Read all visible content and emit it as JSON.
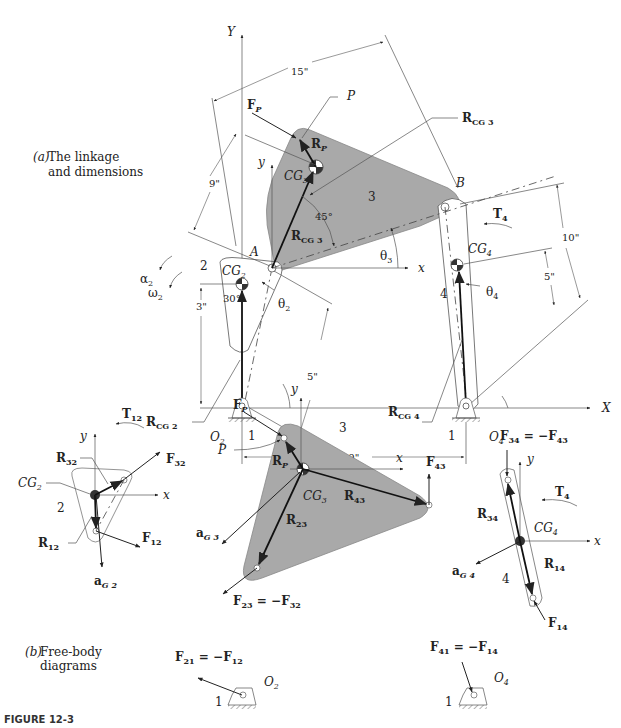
{
  "figure": {
    "caption": "FIGURE 12-3",
    "part_a": {
      "tag": "(a)",
      "title_line1": "The linkage",
      "title_line2": "and dimensions"
    },
    "part_b": {
      "tag": "(b)",
      "title_line1": "Free-body",
      "title_line2": "diagrams"
    }
  },
  "linkage": {
    "axes": {
      "global_x": "X",
      "global_y": "Y",
      "local_x": "x",
      "local_y": "y"
    },
    "points": {
      "A": "A",
      "B": "B",
      "P": "P",
      "O2": "O",
      "O2_sub": "2",
      "O4": "O",
      "O4_sub": "4"
    },
    "links": {
      "ground": "1",
      "crank": "2",
      "coupler": "3",
      "rocker": "4"
    },
    "dimensions": {
      "d15": "15\"",
      "d9": "9\"",
      "d10": "10\"",
      "d5_rocker": "5\"",
      "d3": "3\"",
      "d5_crank": "5\"",
      "d19": "19\"",
      "angle45": "45°",
      "angle30": "30°"
    },
    "labels": {
      "Fp": "F",
      "Fp_sub": "P",
      "Rp": "R",
      "Rp_sub": "P",
      "Rcg3": "R",
      "Rcg3_sub": "CG 3",
      "Rcg2": "R",
      "Rcg2_sub": "CG 2",
      "Rcg4": "R",
      "Rcg4_sub": "CG 4",
      "CG2": "CG",
      "CG2_sub": "2",
      "CG3": "CG",
      "CG3_sub": "3",
      "CG4": "CG",
      "CG4_sub": "4",
      "theta2": "θ",
      "theta2_sub": "2",
      "theta3": "θ",
      "theta3_sub": "3",
      "theta4": "θ",
      "theta4_sub": "4",
      "alpha2": "α",
      "alpha2_sub": "2",
      "omega2": "ω",
      "omega2_sub": "2",
      "T4": "T",
      "T4_sub": "4"
    }
  },
  "fbd": {
    "link2": {
      "T12": "T",
      "T12_sub": "12",
      "R32": "R",
      "R32_sub": "32",
      "F32": "F",
      "F32_sub": "32",
      "CG2": "CG",
      "CG2_sub": "2",
      "num": "2",
      "R12": "R",
      "R12_sub": "12",
      "F12": "F",
      "F12_sub": "12",
      "aG2": "a",
      "aG2_sub": "G 2",
      "x": "x",
      "y": "y"
    },
    "link3": {
      "Fp": "F",
      "Fp_sub": "P",
      "P": "P",
      "Rp": "R",
      "Rp_sub": "P",
      "num": "3",
      "CG3": "CG",
      "CG3_sub": "3",
      "R43": "R",
      "R43_sub": "43",
      "F43": "F",
      "F43_sub": "43",
      "R23": "R",
      "R23_sub": "23",
      "aG3": "a",
      "aG3_sub": "G 3",
      "eq_lhs": "F",
      "eq_lhs_sub": "23",
      "eq_mid": " = −F",
      "eq_rhs_sub": "32",
      "x": "x",
      "y": "y"
    },
    "link4": {
      "eq_lhs": "F",
      "eq_lhs_sub": "34",
      "eq_mid": " = −F",
      "eq_rhs_sub": "43",
      "T4": "T",
      "T4_sub": "4",
      "R34": "R",
      "R34_sub": "34",
      "CG4": "CG",
      "CG4_sub": "4",
      "R14": "R",
      "R14_sub": "14",
      "aG4": "a",
      "aG4_sub": "G 4",
      "num": "4",
      "F14": "F",
      "F14_sub": "14",
      "x": "x",
      "y": "y"
    },
    "ground2": {
      "eq_lhs": "F",
      "eq_lhs_sub": "21",
      "eq_mid": " = −F",
      "eq_rhs_sub": "12",
      "O": "O",
      "O_sub": "2",
      "num": "1"
    },
    "ground4": {
      "eq_lhs": "F",
      "eq_lhs_sub": "41",
      "eq_mid": " = −F",
      "eq_rhs_sub": "14",
      "O": "O",
      "O_sub": "4",
      "num": "1"
    }
  }
}
